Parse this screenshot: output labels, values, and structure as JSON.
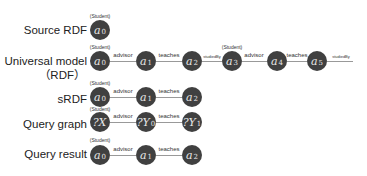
{
  "rows": [
    {
      "label": "Source RDF"
    },
    {
      "label": "Universal model",
      "label2": "（RDF）"
    },
    {
      "label": "sRDF"
    },
    {
      "label": "Query graph"
    },
    {
      "label": "Query result"
    }
  ],
  "type_label": "(Student)",
  "source_rdf": {
    "nodes": [
      {
        "var": "a",
        "sub": "0"
      }
    ]
  },
  "universal": {
    "nodes": [
      {
        "var": "a",
        "sub": "0"
      },
      {
        "var": "a",
        "sub": "1"
      },
      {
        "var": "a",
        "sub": "2"
      },
      {
        "var": "a",
        "sub": "3"
      },
      {
        "var": "a",
        "sub": "4"
      },
      {
        "var": "a",
        "sub": "5"
      }
    ],
    "edges": [
      "advisor",
      "teaches",
      "studiedBy",
      "advisor",
      "teaches",
      "studiedBy"
    ]
  },
  "srdf": {
    "nodes": [
      {
        "var": "a",
        "sub": "0"
      },
      {
        "var": "a",
        "sub": "1"
      },
      {
        "var": "a",
        "sub": "2"
      }
    ],
    "edges": [
      "advisor",
      "teaches"
    ]
  },
  "query_graph": {
    "nodes": [
      {
        "var": "?X",
        "sub": ""
      },
      {
        "var": "?Y",
        "sub": "0"
      },
      {
        "var": "?Y",
        "sub": "1"
      }
    ],
    "edges": [
      "advisor",
      "teaches"
    ]
  },
  "query_result": {
    "nodes": [
      {
        "var": "a",
        "sub": "0"
      },
      {
        "var": "a",
        "sub": "1"
      },
      {
        "var": "a",
        "sub": "2"
      }
    ],
    "edges": [
      "advisor",
      "teaches"
    ]
  }
}
